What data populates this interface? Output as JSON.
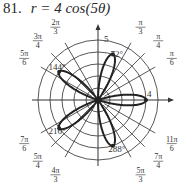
{
  "problem": {
    "number": "81.",
    "equation": "r = 4 cos(5θ)"
  },
  "chart_data": {
    "type": "polar-line",
    "equation": {
      "a": 4,
      "n": 5,
      "func": "cos"
    },
    "rmax_grid": 5,
    "grid_circles": [
      1,
      2,
      3,
      4,
      5
    ],
    "radial_lines_deg": [
      0,
      30,
      45,
      60,
      90,
      120,
      135,
      150,
      180,
      210,
      225,
      240,
      270,
      300,
      315,
      330
    ],
    "angle_labels": [
      {
        "deg": 60,
        "num": "π",
        "den": "3"
      },
      {
        "deg": 45,
        "num": "π",
        "den": "4"
      },
      {
        "deg": 30,
        "num": "π",
        "den": "6"
      },
      {
        "deg": 120,
        "num": "2π",
        "den": "3"
      },
      {
        "deg": 135,
        "num": "3π",
        "den": "4"
      },
      {
        "deg": 150,
        "num": "5π",
        "den": "6"
      },
      {
        "deg": 210,
        "num": "7π",
        "den": "6"
      },
      {
        "deg": 225,
        "num": "5π",
        "den": "4"
      },
      {
        "deg": 240,
        "num": "4π",
        "den": "3"
      },
      {
        "deg": 300,
        "num": "5π",
        "den": "3"
      },
      {
        "deg": 315,
        "num": "7π",
        "den": "4"
      },
      {
        "deg": 330,
        "num": "11π",
        "den": "6"
      }
    ],
    "axis_labels": [
      {
        "text": "5",
        "position": "top of vertical axis"
      },
      {
        "text": "4",
        "position": "tip of 0° petal"
      }
    ],
    "petal_tips": [
      {
        "deg": 0,
        "r": 4,
        "label": ""
      },
      {
        "deg": 72,
        "r": 4,
        "label": "72°"
      },
      {
        "deg": 144,
        "r": 4,
        "label": "144°"
      },
      {
        "deg": 216,
        "r": 4,
        "label": "216°"
      },
      {
        "deg": 288,
        "r": 4,
        "label": "288°"
      }
    ],
    "marked_points": [
      {
        "theta_deg": 0,
        "r": 4
      },
      {
        "theta_deg": 72,
        "r": 4
      },
      {
        "theta_deg": 144,
        "r": 4
      },
      {
        "theta_deg": 216,
        "r": 4
      },
      {
        "theta_deg": 288,
        "r": 4
      }
    ],
    "grid": true,
    "legend": "none"
  },
  "style": {
    "curve_color": "#222222",
    "grid_color": "#444444",
    "axis_color": "#333333"
  }
}
